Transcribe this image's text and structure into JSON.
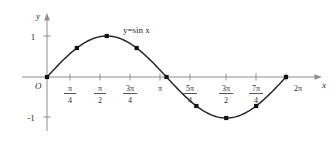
{
  "figure": {
    "title": "y=sin x",
    "equation_label": "y=sin x",
    "origin_label": "O",
    "x_axis_label": "x",
    "y_axis_label": "y"
  },
  "chart_data": {
    "type": "line",
    "title": "y=sin x",
    "xlabel": "x",
    "ylabel": "y",
    "xlim": [
      0,
      6.2832
    ],
    "ylim": [
      -1.3,
      1.3
    ],
    "grid": false,
    "legend": "none",
    "annotations": [
      "y=sin x"
    ],
    "x_tick_labels": [
      "O",
      "π/4",
      "π/2",
      "3π/4",
      "π",
      "5π/4",
      "3π/2",
      "7π/4",
      "2π"
    ],
    "x_tick_values": [
      0,
      0.7854,
      1.5708,
      2.3562,
      3.1416,
      3.927,
      4.7124,
      5.4978,
      6.2832
    ],
    "y_tick_labels": [
      "1",
      "-1"
    ],
    "y_tick_values": [
      1,
      -1
    ],
    "series": [
      {
        "name": "y=sin x",
        "x": [
          0,
          0.7854,
          1.5708,
          2.3562,
          3.1416,
          3.927,
          4.7124,
          5.4978,
          6.2832
        ],
        "values": [
          0,
          0.7071,
          1,
          0.7071,
          0,
          -0.7071,
          -1,
          -0.7071,
          0
        ],
        "marked_points": true
      }
    ]
  },
  "ticks": {
    "x": [
      {
        "num": "π",
        "den": "4",
        "whole": "",
        "px": 70
      },
      {
        "num": "π",
        "den": "2",
        "whole": "",
        "px": 100
      },
      {
        "num": "3π",
        "den": "4",
        "whole": "",
        "px": 130
      },
      {
        "num": "",
        "den": "",
        "whole": "π",
        "px": 160
      },
      {
        "num": "5π",
        "den": "4",
        "whole": "",
        "px": 190
      },
      {
        "num": "3π",
        "den": "2",
        "whole": "",
        "px": 226
      },
      {
        "num": "7π",
        "den": "4",
        "whole": "",
        "px": 256
      },
      {
        "num": "",
        "den": "",
        "whole": "2π",
        "px": 290
      }
    ],
    "y": [
      {
        "label": "1",
        "px": 36
      },
      {
        "label": "-1",
        "px": 117
      }
    ]
  }
}
